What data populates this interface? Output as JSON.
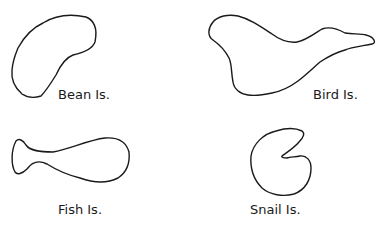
{
  "figure": {
    "islands": [
      {
        "id": "bean",
        "label": "Bean Is.",
        "shape": "bean-shaped closed outline"
      },
      {
        "id": "bird",
        "label": "Bird Is.",
        "shape": "bird-shaped closed outline"
      },
      {
        "id": "fish",
        "label": "Fish Is.",
        "shape": "fish-shaped closed outline"
      },
      {
        "id": "snail",
        "label": "Snail Is.",
        "shape": "snail-shaped closed outline (C with notch)"
      }
    ],
    "stroke_color": "#1a1a1a",
    "background_color": "#ffffff"
  }
}
